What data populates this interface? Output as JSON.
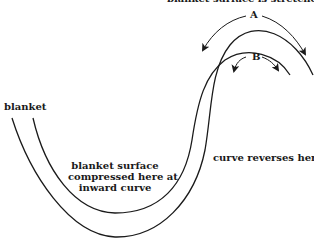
{
  "diagram": {
    "top_caption": "blanket surface is stretched at",
    "labels": {
      "blanket": "blanket",
      "compressed_line1": "blanket surface",
      "compressed_line2": "compressed here at",
      "compressed_line3": "inward curve",
      "reverses": "curve reverses here",
      "arc_a": "A",
      "arc_b": "B"
    },
    "colors": {
      "stroke": "#1a1a1a",
      "background": "#ffffff"
    }
  }
}
